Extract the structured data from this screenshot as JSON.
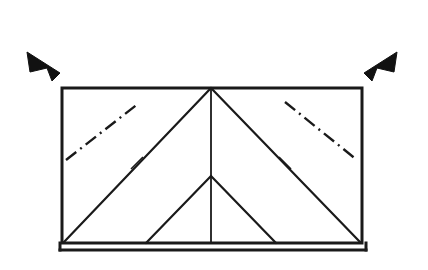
{
  "figure": {
    "background_color": "#ffffff",
    "ink_color": "#1a1a1a",
    "width": 428,
    "height": 270
  },
  "canvas": {
    "viewbox": "0 0 428 270"
  },
  "outline": {
    "name": "roof-outline-rectangle",
    "stroke_color": "#1a1a1a",
    "stroke_width": 3,
    "fill": "none",
    "left": 62,
    "top": 88,
    "right": 362,
    "bottom": 243,
    "points": "62,88 362,88 362,243 62,243 62,88"
  },
  "base_line": {
    "name": "ground-base-line",
    "stroke_color": "#1a1a1a",
    "stroke_width": 3,
    "x1": 60,
    "y1": 250,
    "x2": 366,
    "y2": 250
  },
  "base_line_caps": {
    "left": {
      "x1": 60,
      "y1": 243,
      "x2": 60,
      "y2": 250
    },
    "right": {
      "x1": 366,
      "y1": 243,
      "x2": 366,
      "y2": 250
    }
  },
  "ridge_apex": {
    "name": "ridge-apex-point",
    "x": 211,
    "y": 88
  },
  "hip_lines": [
    {
      "name": "hip-line-left",
      "x1": 211,
      "y1": 88,
      "x2": 64,
      "y2": 242,
      "stroke_width": 2.2
    },
    {
      "name": "hip-line-right",
      "x1": 211,
      "y1": 88,
      "x2": 360,
      "y2": 242,
      "stroke_width": 2.2
    }
  ],
  "center_ridge_line": {
    "name": "center-vertical-ridge-line",
    "x1": 211,
    "y1": 88,
    "x2": 211,
    "y2": 243,
    "stroke_width": 1.8
  },
  "inner_gable": {
    "name": "inner-gable-triangle",
    "apex_x": 211,
    "apex_y": 176,
    "left_x": 146,
    "left_y": 243,
    "right_x": 276,
    "right_y": 243,
    "stroke_width": 2.2
  },
  "dash_dot_lines": [
    {
      "name": "valley-centerline-left",
      "x1": 66,
      "y1": 160,
      "x2": 139,
      "y2": 103,
      "stroke_width": 2.4,
      "dash_pattern": "13 5 2 5"
    },
    {
      "name": "valley-centerline-right",
      "x1": 285,
      "y1": 102,
      "x2": 357,
      "y2": 160,
      "stroke_width": 2.4,
      "dash_pattern": "13 5 2 5"
    }
  ],
  "tick_marks": [
    {
      "name": "tick-mark-left-hip",
      "cx": 137,
      "cy": 163,
      "x1": 131,
      "y1": 169,
      "x2": 143,
      "y2": 157,
      "stroke_width": 1.6
    },
    {
      "name": "tick-mark-right-hip",
      "cx": 285,
      "cy": 163,
      "x1": 279,
      "y1": 157,
      "x2": 291,
      "y2": 169,
      "stroke_width": 1.6
    }
  ],
  "arrows": [
    {
      "name": "direction-arrow-left",
      "label": "left-pointing solid triangle",
      "fill": "#111111",
      "points": "27,52 60,73 52,81 47,68 30,72"
    },
    {
      "name": "direction-arrow-right",
      "label": "right-pointing solid triangle",
      "fill": "#111111",
      "points": "397,52 364,73 372,81 377,68 394,72"
    }
  ]
}
